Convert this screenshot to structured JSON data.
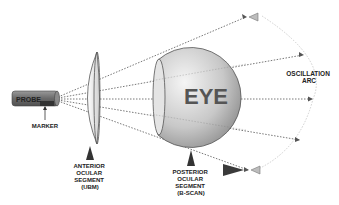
{
  "diagram": {
    "labels": {
      "probe": "PROBE",
      "marker": "MARKER",
      "eye": "EYE",
      "oscillation_arc": [
        "OSCILLATION",
        "ARC"
      ],
      "anterior": [
        "ANTERIOR",
        "OCULAR",
        "SEGMENT",
        "(UBM)"
      ],
      "posterior": [
        "POSTERIOR",
        "OCULAR",
        "SEGMENT",
        "(B-SCAN)"
      ]
    },
    "colors": {
      "probe": "#6e6e6e",
      "marker": "#333333",
      "eye_fill_light": "#f2f2f2",
      "eye_fill_dark": "#9a9a9a",
      "eye_text": "#555555",
      "beam": "#666666",
      "arc": "#cccccc"
    }
  }
}
